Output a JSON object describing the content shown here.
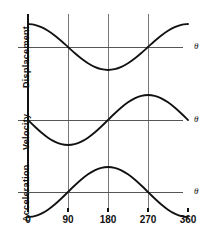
{
  "figure": {
    "background_color": "#ffffff",
    "line_color": "#111111",
    "axis_color": "#555555",
    "grid_color": "#777777"
  },
  "x_axis": {
    "label": "",
    "tick_labels": [
      "0",
      "90",
      "180",
      "270",
      "360"
    ],
    "tick_values": [
      0,
      90,
      180,
      270,
      360
    ],
    "range": [
      0,
      360
    ],
    "unit": "degrees"
  },
  "panels": [
    {
      "name": "displacement",
      "y_label": "Displacement",
      "theta_label": "θ",
      "curve": "cos"
    },
    {
      "name": "velocity",
      "y_label": "Velocity",
      "theta_label": "θ",
      "curve": "-sin"
    },
    {
      "name": "acceleration",
      "y_label": "Acceleration",
      "theta_label": "θ",
      "curve": "-cos"
    }
  ],
  "chart_data": {
    "type": "line",
    "title": "",
    "subtitle": "",
    "xlabel": "θ (degrees)",
    "ylabel": "",
    "xlim": [
      0,
      360
    ],
    "ylim": [
      -1,
      1
    ],
    "grid": true,
    "grid_axis": "x",
    "legend_position": "none",
    "x": [
      0,
      15,
      30,
      45,
      60,
      75,
      90,
      105,
      120,
      135,
      150,
      165,
      180,
      195,
      210,
      225,
      240,
      255,
      270,
      285,
      300,
      315,
      330,
      345,
      360
    ],
    "xticks": [
      0,
      90,
      180,
      270,
      360
    ],
    "xticklabels": [
      "0",
      "90",
      "180",
      "270",
      "360"
    ],
    "series": [
      {
        "name": "Displacement",
        "formula": "cos(theta)",
        "panel": 0,
        "values": [
          1.0,
          0.966,
          0.866,
          0.707,
          0.5,
          0.259,
          0.0,
          -0.259,
          -0.5,
          -0.707,
          -0.866,
          -0.966,
          -1.0,
          -0.966,
          -0.866,
          -0.707,
          -0.5,
          -0.259,
          0.0,
          0.259,
          0.5,
          0.707,
          0.866,
          0.966,
          1.0
        ]
      },
      {
        "name": "Velocity",
        "formula": "-sin(theta)",
        "panel": 1,
        "values": [
          0.0,
          -0.259,
          -0.5,
          -0.707,
          -0.866,
          -0.966,
          -1.0,
          -0.966,
          -0.866,
          -0.707,
          -0.5,
          -0.259,
          0.0,
          0.259,
          0.5,
          0.707,
          0.866,
          0.966,
          1.0,
          0.966,
          0.866,
          0.707,
          0.5,
          0.259,
          0.0
        ]
      },
      {
        "name": "Acceleration",
        "formula": "-cos(theta)",
        "panel": 2,
        "values": [
          -1.0,
          -0.966,
          -0.866,
          -0.707,
          -0.5,
          -0.259,
          0.0,
          0.259,
          0.5,
          0.707,
          0.866,
          0.966,
          1.0,
          0.966,
          0.866,
          0.707,
          0.5,
          0.259,
          0.0,
          -0.259,
          -0.5,
          -0.707,
          -0.866,
          -0.966,
          -1.0
        ]
      }
    ],
    "annotations": [
      {
        "text": "θ",
        "panel": 0,
        "position": "right-of-zero-axis"
      },
      {
        "text": "θ",
        "panel": 1,
        "position": "right-of-zero-axis"
      },
      {
        "text": "θ",
        "panel": 2,
        "position": "right-of-zero-axis"
      }
    ]
  }
}
